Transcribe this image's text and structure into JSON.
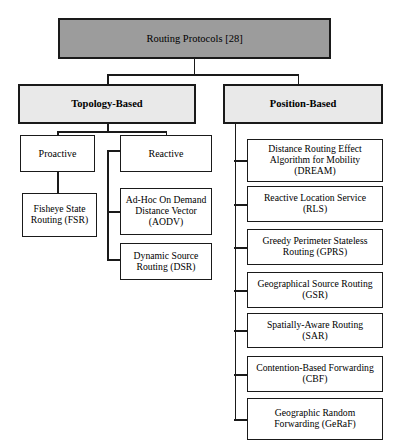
{
  "diagram": {
    "colors": {
      "root_fill": "#9c9c9c",
      "level2_fill": "#e9e9e9",
      "leaf_fill": "#ffffff",
      "border": "#1a1a1a",
      "background": "#ffffff"
    },
    "root": {
      "label": "Routing Protocols [28]"
    },
    "level2": [
      {
        "label": "Topology-Based"
      },
      {
        "label": "Position-Based"
      }
    ],
    "level3": [
      {
        "label": "Proactive"
      },
      {
        "label": "Reactive"
      }
    ],
    "proactive_children": [
      {
        "label": "Fisheye State\nRouting (FSR)"
      }
    ],
    "reactive_children": [
      {
        "label": "Ad-Hoc On Demand\nDistance Vector\n(AODV)"
      },
      {
        "label": "Dynamic Source\nRouting (DSR)"
      }
    ],
    "position_children": [
      {
        "label": "Distance Routing Effect\nAlgorithm for Mobility\n(DREAM)"
      },
      {
        "label": "Reactive Location Service\n(RLS)"
      },
      {
        "label": "Greedy Perimeter Stateless\nRouting (GPRS)"
      },
      {
        "label": "Geographical Source Routing\n(GSR)"
      },
      {
        "label": "Spatially-Aware Routing\n(SAR)"
      },
      {
        "label": "Contention-Based Forwarding\n(CBF)"
      },
      {
        "label": "Geographic Random\nForwarding (GeRaF)"
      }
    ]
  }
}
